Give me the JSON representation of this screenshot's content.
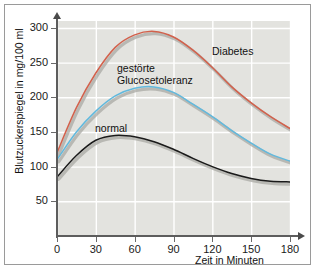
{
  "chart_data": {
    "type": "line",
    "title": "",
    "xlabel": "Zeit in Minuten",
    "ylabel": "Blutzuckerspiegel in mg/100 ml",
    "xlim": [
      0,
      180
    ],
    "ylim": [
      0,
      310
    ],
    "xticks": [
      "0",
      "30",
      "60",
      "90",
      "120",
      "150",
      "180"
    ],
    "yticks": [
      "50",
      "100",
      "150",
      "200",
      "250",
      "300"
    ],
    "grid": true,
    "legend_position": "inline-annotations",
    "annotations": [
      "Diabetes",
      "gestörte Glucosetoleranz",
      "normal"
    ],
    "colors": {
      "diabetes": "#d2614c",
      "impaired_glucose_tolerance": "#62b9dd",
      "normal": "#1a1a1a",
      "plot_background": "#e3e3df",
      "gridline": "#ffffff",
      "axis": "#5d5d5d"
    },
    "x": [
      0,
      15,
      30,
      45,
      60,
      75,
      90,
      105,
      120,
      135,
      150,
      165,
      180
    ],
    "series": [
      {
        "name": "Diabetes",
        "color": "#d2614c",
        "values": [
          120,
          185,
          235,
          272,
          290,
          295,
          287,
          268,
          243,
          215,
          192,
          172,
          155
        ]
      },
      {
        "name": "gestörte Glucosetoleranz",
        "color": "#62b9dd",
        "values": [
          110,
          150,
          180,
          202,
          213,
          215,
          207,
          190,
          172,
          152,
          134,
          118,
          108
        ]
      },
      {
        "name": "normal",
        "color": "#1a1a1a",
        "values": [
          85,
          116,
          138,
          145,
          143,
          136,
          125,
          112,
          100,
          90,
          83,
          79,
          78
        ]
      }
    ]
  },
  "axis_titles": {
    "y": "Blutzuckerspiegel in mg/100 ml",
    "x": "Zeit in Minuten"
  },
  "curve_labels": {
    "diabetes": "Diabetes",
    "igt_line1": "gestörte",
    "igt_line2": "Glucosetoleranz",
    "normal": "normal"
  }
}
